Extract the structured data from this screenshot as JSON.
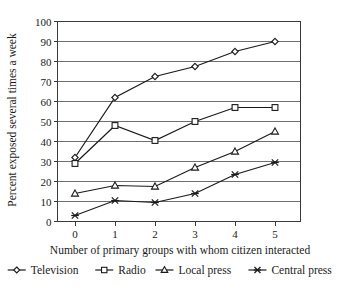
{
  "chart_data": {
    "type": "line",
    "title": "",
    "xlabel": "Number of primary groups with whom citizen interacted",
    "ylabel": "Percent exposed several times a week",
    "x": [
      0,
      1,
      2,
      3,
      4,
      5
    ],
    "xtick_labels": [
      "0",
      "1",
      "2",
      "3",
      "4",
      "5"
    ],
    "ytick_labels": [
      "0",
      "10",
      "20",
      "30",
      "40",
      "50",
      "60",
      "70",
      "80",
      "90",
      "100"
    ],
    "ylim": [
      0,
      100
    ],
    "xlim": [
      -0.45,
      5.6
    ],
    "grid": "horizontal",
    "legend_position": "bottom",
    "series": [
      {
        "name": "Television",
        "marker": "diamond",
        "values": [
          32,
          62,
          72.5,
          77.5,
          85,
          90
        ]
      },
      {
        "name": "Radio",
        "marker": "square",
        "values": [
          29,
          48,
          40.5,
          50,
          57,
          57
        ]
      },
      {
        "name": "Local press",
        "marker": "triangle",
        "values": [
          14,
          18,
          17.5,
          27,
          35,
          45
        ]
      },
      {
        "name": "Central press",
        "marker": "x",
        "values": [
          3,
          10.5,
          9.5,
          14,
          23.5,
          29.5
        ]
      }
    ]
  },
  "colors": {
    "ink": "#1a1a1a",
    "grid": "#6f6f6f",
    "frame": "#3a3a3a",
    "background": "#ffffff"
  }
}
